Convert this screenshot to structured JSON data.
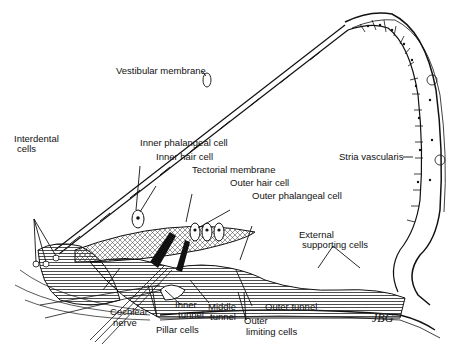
{
  "figure": {
    "labels": {
      "vestibular_membrane": "Vestibular membrane",
      "interdental_cells_1": "Interdental",
      "interdental_cells_2": "cells",
      "inner_phalangeal_cell": "Inner phalangeal cell",
      "inner_hair_cell": "Inner hair cell",
      "tectorial_membrane": "Tectorial membrane",
      "outer_hair_cell": "Outer hair cell",
      "outer_phalangeal_cell": "Outer phalangeal cell",
      "stria_vascularis": "Stria vascularis",
      "external_supporting_cells_1": "External",
      "external_supporting_cells_2": "supporting cells",
      "cochlear_nerve_1": "Cochlear",
      "cochlear_nerve_2": "nerve",
      "pillar_cells": "Pillar cells",
      "inner_tunnel_1": "Inner",
      "inner_tunnel_2": "tunnel",
      "middle_tunnel_1": "Middle",
      "middle_tunnel_2": "tunnel",
      "outer_tunnel": "Outer tunnel",
      "outer_limiting_cells_1": "Outer",
      "outer_limiting_cells_2": "limiting cells"
    },
    "signature": "JBG"
  }
}
